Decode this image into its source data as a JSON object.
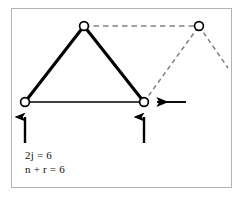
{
  "figure": {
    "type": "truss-mechanism-diagram",
    "background_color": "#ffffff",
    "frame_border_color": "#b3b3b3",
    "solid_line_color": "#000000",
    "dashed_line_color": "#808080",
    "node_fill_color": "#ffffff",
    "node_stroke_color": "#000000",
    "nodes": [
      {
        "id": "left-support-node",
        "x": 25,
        "y": 102,
        "r": 4.6,
        "style": "solid"
      },
      {
        "id": "apex-node",
        "x": 84,
        "y": 26,
        "r": 4.6,
        "style": "solid"
      },
      {
        "id": "middle-support-node",
        "x": 144,
        "y": 102,
        "r": 4.6,
        "style": "solid"
      },
      {
        "id": "right-apex-node",
        "x": 199,
        "y": 26,
        "r": 4.6,
        "style": "dashed"
      }
    ],
    "solid_members": [
      {
        "id": "member-left-rise",
        "from": "left-support-node",
        "to": "apex-node"
      },
      {
        "id": "member-right-fall",
        "from": "apex-node",
        "to": "middle-support-node"
      },
      {
        "id": "member-base-chord",
        "from": "left-support-node",
        "to": "middle-support-node"
      }
    ],
    "dashed_members": [
      {
        "id": "dashed-top-chord",
        "from": "apex-node",
        "to": "right-apex-node"
      },
      {
        "id": "dashed-rise",
        "from": "middle-support-node",
        "to": "right-apex-node"
      },
      {
        "id": "dashed-tail",
        "from": "right-apex-node",
        "to_point": {
          "x": 228,
          "y": 68
        }
      }
    ],
    "arrows": [
      {
        "id": "reaction-arrow-left",
        "direction": "up",
        "tip_x": 25,
        "tip_y": 108,
        "tail_x": 25,
        "tail_y": 143
      },
      {
        "id": "reaction-arrow-middle",
        "direction": "up",
        "tip_x": 144,
        "tip_y": 108,
        "tail_x": 144,
        "tail_y": 143
      },
      {
        "id": "load-arrow-horizontal",
        "direction": "left",
        "tip_x": 150,
        "tip_y": 102,
        "tail_x": 186,
        "tail_y": 102
      }
    ]
  },
  "annotations": {
    "equation_1": "2j = 6",
    "equation_2": "n + r = 6"
  }
}
